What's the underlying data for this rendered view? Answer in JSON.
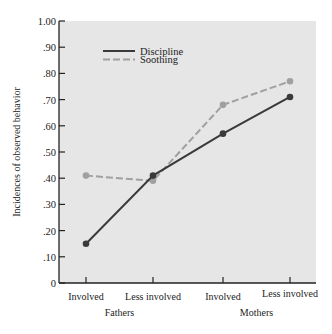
{
  "chart_data": {
    "type": "line",
    "title": "",
    "xlabel": "",
    "ylabel": "Incidences of observed behavior",
    "ylim": [
      0,
      1.0
    ],
    "yticks": [
      "0",
      ".10",
      ".20",
      ".30",
      ".40",
      ".50",
      ".60",
      ".70",
      ".80",
      ".90",
      "1.00"
    ],
    "categories": [
      "Involved",
      "Less involved",
      "Involved",
      "Less involved"
    ],
    "groups": [
      {
        "label": "Fathers",
        "categories": [
          "Involved",
          "Less involved"
        ]
      },
      {
        "label": "Mothers",
        "categories": [
          "Involved",
          "Less involved"
        ]
      }
    ],
    "series": [
      {
        "name": "Discipline",
        "style": "solid",
        "color": "#3a3a3a",
        "values": [
          0.15,
          0.41,
          0.57,
          0.71
        ]
      },
      {
        "name": "Soothing",
        "style": "dashed",
        "color": "#a0a0a0",
        "values": [
          0.41,
          0.39,
          0.68,
          0.77
        ]
      }
    ],
    "legend_position": "upper left inside",
    "grid": false
  },
  "colors": {
    "plot_background": "#e6e6e6",
    "axis": "#222222"
  }
}
